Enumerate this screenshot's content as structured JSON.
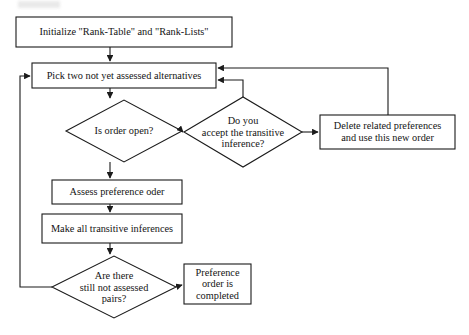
{
  "figure": {
    "type": "flowchart",
    "title": "",
    "orientation": "top-down",
    "stroke_color": "#1b1b1b",
    "background_color": "#ffffff"
  },
  "nodes": {
    "initialize": {
      "id": "initialize",
      "shape": "process",
      "label": "Initialize \"Rank-Table\" and \"Rank-Lists\"",
      "x": 16,
      "y": 17,
      "w": 216,
      "h": 30
    },
    "pick_two": {
      "id": "pick_two",
      "shape": "process",
      "label": "Pick two not yet assessed alternatives",
      "x": 32,
      "y": 63,
      "w": 184,
      "h": 25
    },
    "is_order_open": {
      "id": "is_order_open",
      "shape": "decision",
      "label": "Is order open?",
      "cx": 124,
      "cy": 131,
      "w": 116,
      "h": 62
    },
    "accept_inference": {
      "id": "accept_inference",
      "shape": "decision",
      "label": "Do you\naccept the transitive\ninference?",
      "cx": 243,
      "cy": 132,
      "w": 119,
      "h": 70
    },
    "delete_preferences": {
      "id": "delete_preferences",
      "shape": "process",
      "label": "Delete related preferences\nand use this new order",
      "x": 320,
      "y": 115,
      "w": 135,
      "h": 34
    },
    "assess_preference": {
      "id": "assess_preference",
      "shape": "process",
      "label": "Assess preference oder",
      "x": 52,
      "y": 180,
      "w": 130,
      "h": 24
    },
    "make_inferences": {
      "id": "make_inferences",
      "shape": "process",
      "label": "Make all transitive inferences",
      "x": 42,
      "y": 214,
      "w": 140,
      "h": 29
    },
    "still_not_assessed": {
      "id": "still_not_assessed",
      "shape": "decision",
      "label": "Are there\nstill not assessed\npairs?",
      "cx": 114,
      "cy": 287,
      "w": 124,
      "h": 62
    },
    "preference_completed": {
      "id": "preference_completed",
      "shape": "process",
      "label": "Preference\norder is\ncompleted",
      "x": 184,
      "y": 264,
      "w": 67,
      "h": 40
    }
  },
  "edges": [
    {
      "id": "edge-initialize-to-pick-two",
      "from": "initialize",
      "to": "pick_two",
      "label": ""
    },
    {
      "id": "edge-pick-two-to-is-order-open",
      "from": "pick_two",
      "to": "is_order_open",
      "label": ""
    },
    {
      "id": "edge-is-order-open-to-accept-inference",
      "from": "is_order_open",
      "to": "accept_inference",
      "label": ""
    },
    {
      "id": "edge-is-order-open-to-assess-preference",
      "from": "is_order_open",
      "to": "assess_preference",
      "label": ""
    },
    {
      "id": "edge-accept-inference-to-pick-two",
      "from": "accept_inference",
      "to": "pick_two",
      "label": ""
    },
    {
      "id": "edge-accept-inference-to-delete-preferences",
      "from": "accept_inference",
      "to": "delete_preferences",
      "label": ""
    },
    {
      "id": "edge-delete-preferences-to-pick-two",
      "from": "delete_preferences",
      "to": "pick_two",
      "label": ""
    },
    {
      "id": "edge-assess-preference-to-make-inferences",
      "from": "assess_preference",
      "to": "make_inferences",
      "label": ""
    },
    {
      "id": "edge-make-inferences-to-still-not-assessed",
      "from": "make_inferences",
      "to": "still_not_assessed",
      "label": ""
    },
    {
      "id": "edge-still-not-assessed-to-pick-two",
      "from": "still_not_assessed",
      "to": "pick_two",
      "label": ""
    },
    {
      "id": "edge-still-not-assessed-to-preference-completed",
      "from": "still_not_assessed",
      "to": "preference_completed",
      "label": ""
    }
  ]
}
